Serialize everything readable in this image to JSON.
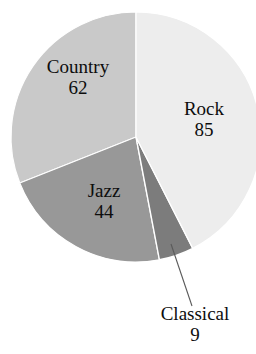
{
  "chart_data": {
    "type": "pie",
    "title": "",
    "subtitle": "",
    "xlabel": "",
    "ylabel": "",
    "legend_position": "none",
    "grid": false,
    "total": 200,
    "categories": [
      "Rock",
      "Classical",
      "Jazz",
      "Country"
    ],
    "values": [
      85,
      9,
      44,
      62
    ],
    "slices": [
      {
        "label": "Rock",
        "value": "85",
        "numeric": 85,
        "color": "#ededed",
        "start_angle_deg": 0,
        "end_angle_deg": 153,
        "label_placement": "inside"
      },
      {
        "label": "Classical",
        "value": "9",
        "numeric": 9,
        "color": "#7c7c7c",
        "start_angle_deg": 153,
        "end_angle_deg": 169.2,
        "label_placement": "outside-leader"
      },
      {
        "label": "Jazz",
        "value": "44",
        "numeric": 44,
        "color": "#989898",
        "start_angle_deg": 169.2,
        "end_angle_deg": 248.4,
        "label_placement": "inside"
      },
      {
        "label": "Country",
        "value": "62",
        "numeric": 62,
        "color": "#c9c9c9",
        "start_angle_deg": 248.4,
        "end_angle_deg": 360,
        "label_placement": "inside"
      }
    ],
    "colors": {
      "rock": "#ededed",
      "classical": "#7c7c7c",
      "jazz": "#989898",
      "country": "#c9c9c9",
      "background": "#ffffff",
      "separator": "#ffffff",
      "leader_line": "#5a5a5a",
      "text": "#0d0d0d"
    }
  }
}
